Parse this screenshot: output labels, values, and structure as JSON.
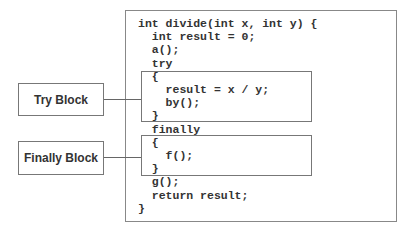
{
  "code_lines": [
    "int divide(int x, int y) {",
    "  int result = 0;",
    "  a();",
    "  try",
    "  {",
    "    result = x / y;",
    "    by();",
    "  }",
    "  finally",
    "  {",
    "    f();",
    "  }",
    "  g();",
    "  return result;",
    "}"
  ],
  "labels": {
    "try_block": "Try Block",
    "finally_block": "Finally Block"
  }
}
